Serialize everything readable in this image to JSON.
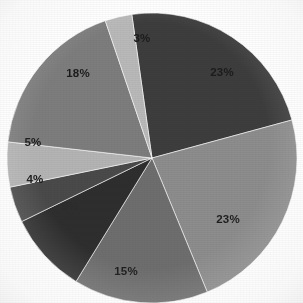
{
  "chart_data": {
    "type": "pie",
    "title": "",
    "subtitle": "",
    "xlabel": "",
    "ylabel": "",
    "legend": "none",
    "grid": false,
    "value_unit": "%",
    "start_angle_deg": -8,
    "direction": "clockwise",
    "center": {
      "x": 152,
      "y": 158
    },
    "radius": 145,
    "categories": [
      "Slice 1",
      "Slice 2",
      "Slice 3",
      "Slice 4",
      "Slice 5",
      "Slice 6",
      "Slice 7",
      "Slice 8"
    ],
    "values": [
      23,
      23,
      15,
      9,
      4,
      5,
      18,
      3
    ],
    "labels": [
      "23%",
      "23%",
      "15%",
      "9%",
      "4%",
      "5%",
      "18%",
      "3%"
    ],
    "colors": [
      "#3d3d3d",
      "#8d8d8d",
      "#6e6e6e",
      "#2e2e2e",
      "#4a4a4a",
      "#b4b4b4",
      "#7d7d7d",
      "#b9b9b9"
    ],
    "label_colors": [
      "#1c1c1c",
      "#1f1f1f",
      "#1c1c1c",
      "#232323",
      "#1a1a1a",
      "#1c1c1c",
      "#1c1c1c",
      "#1c1c1c"
    ],
    "label_visible": [
      true,
      true,
      true,
      false,
      true,
      true,
      true,
      true
    ],
    "label_positions": [
      {
        "x": 222,
        "y": 73
      },
      {
        "x": 228,
        "y": 220
      },
      {
        "x": 126,
        "y": 272
      },
      {
        "x": 70,
        "y": 207
      },
      {
        "x": 35,
        "y": 180
      },
      {
        "x": 33,
        "y": 143
      },
      {
        "x": 78,
        "y": 74
      },
      {
        "x": 142,
        "y": 39
      }
    ],
    "background_color": "#ffffff",
    "slice_border_color": "#ffffff",
    "slice_border_width": 0.6
  },
  "figure": {
    "name": "pie-chart",
    "width": 303,
    "height": 303
  }
}
